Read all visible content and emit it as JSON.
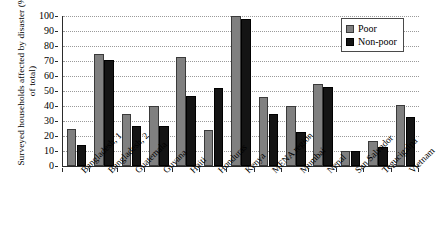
{
  "chart_data": {
    "type": "bar",
    "title": "",
    "xlabel": "",
    "ylabel": "Surveyed households affected by disaster (% of total)",
    "ylim": [
      0,
      100
    ],
    "yticks": [
      0,
      10,
      20,
      30,
      40,
      50,
      60,
      70,
      80,
      90,
      100
    ],
    "grid": true,
    "legend_position": "top-right",
    "categories": [
      "Bangladesh, 1",
      "Bangladesh, 2",
      "Guatemala",
      "Guyana",
      "Haiti",
      "Honduras",
      "Kenya",
      "MENA region",
      "Mumbai",
      "Nepal",
      "San Salvador",
      "Tegucigalpa",
      "Vietnam"
    ],
    "series": [
      {
        "name": "Poor",
        "color": "#808080",
        "values": [
          25,
          75,
          35,
          40,
          73,
          24,
          100,
          46,
          40,
          55,
          10,
          17,
          41
        ]
      },
      {
        "name": "Non-poor",
        "color": "#141414",
        "values": [
          14,
          71,
          27,
          27,
          47,
          52,
          98,
          35,
          23,
          53,
          10,
          13,
          33
        ]
      }
    ]
  },
  "legend": {
    "entries": [
      {
        "label": "Poor"
      },
      {
        "label": "Non-poor"
      }
    ]
  }
}
